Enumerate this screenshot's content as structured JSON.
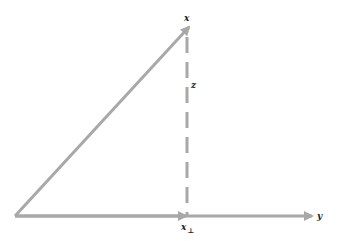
{
  "diagram": {
    "type": "vector-projection",
    "colors": {
      "line": "#a8a8a8",
      "text": "#222222",
      "background": "#ffffff"
    },
    "labels": {
      "x": "x",
      "y": "y",
      "z": "z",
      "x_perp_base": "x",
      "x_perp_sub": "⊥"
    },
    "vectors": [
      {
        "name": "x",
        "from": [
          15,
          216
        ],
        "to": [
          190,
          25
        ],
        "style": "solid",
        "arrow": true
      },
      {
        "name": "y",
        "from": [
          15,
          216
        ],
        "to": [
          313,
          216
        ],
        "style": "solid",
        "arrow": true
      },
      {
        "name": "x_perp",
        "from": [
          15,
          216
        ],
        "to": [
          187,
          216
        ],
        "style": "solid",
        "arrow": true
      },
      {
        "name": "z",
        "from": [
          187,
          216
        ],
        "to": [
          187,
          28
        ],
        "style": "dashed",
        "arrow": false
      }
    ]
  }
}
